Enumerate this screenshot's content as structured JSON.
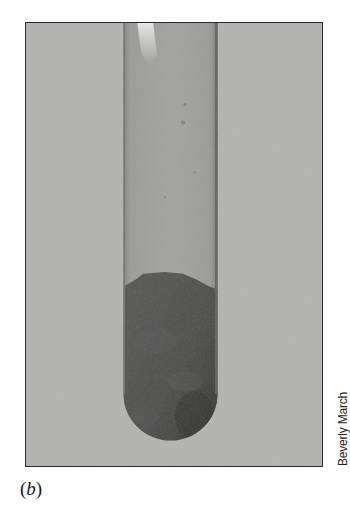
{
  "figure": {
    "photo": {
      "subject": "test-tube-with-dark-solid",
      "description": "Glass test tube against gray background containing a dark solid at its rounded bottom",
      "colors": {
        "background": "#b3b3b1",
        "tube_glass": "#9d9d9b",
        "tube_edge": "#6e6e6c",
        "solid_dark": "#4a4a49",
        "solid_darker": "#333332",
        "highlight": "#e6e6e4",
        "frame_border": "#2a2a2a"
      }
    },
    "credit": "Beverly March",
    "panel_label": {
      "open": "(",
      "letter": "b",
      "close": ")"
    }
  }
}
